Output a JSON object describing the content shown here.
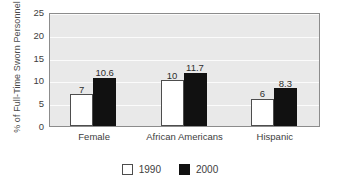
{
  "chart_data": {
    "type": "bar",
    "title": "",
    "subtitle": "",
    "xlabel": "",
    "ylabel": "% of Full-Time Sworn Personnel",
    "categories": [
      "Female",
      "African Americans",
      "Hispanic"
    ],
    "series": [
      {
        "name": "1990",
        "color": "#ffffff",
        "values": [
          7,
          10,
          6
        ],
        "value_labels": [
          "7",
          "10",
          "6"
        ]
      },
      {
        "name": "2000",
        "color": "#111111",
        "values": [
          10.6,
          11.7,
          8.3
        ],
        "value_labels": [
          "10.6",
          "11.7",
          "8.3"
        ]
      }
    ],
    "ylim": [
      0,
      25
    ],
    "ytick_values": [
      0,
      5,
      10,
      15,
      20,
      25
    ],
    "ytick_labels": [
      "0",
      "5",
      "10",
      "15",
      "20",
      "25"
    ],
    "grid": "horizontal",
    "legend_position": "bottom-center",
    "plot_background": "#e9e9e9",
    "gridline_color": "#fbfbfb",
    "axis_color": "#8c8c8c"
  }
}
